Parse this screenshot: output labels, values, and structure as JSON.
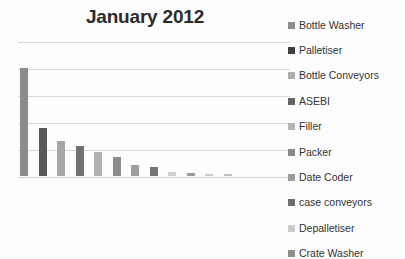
{
  "chart_data": {
    "type": "bar",
    "title": "January 2012",
    "xlabel": "",
    "ylabel": "",
    "grid": true,
    "legend_position": "right",
    "axis_tick_labels": [],
    "ylim": [
      0,
      120
    ],
    "categories": [
      "Bottle Washer",
      "Palletiser",
      "Bottle Conveyors",
      "ASEBI",
      "Filler",
      "Packer",
      "Date Coder",
      "case conveyors",
      "Depalletiser",
      "Crate Washer",
      "",
      ""
    ],
    "values": [
      96,
      43,
      31,
      27,
      21,
      17,
      10,
      8,
      4,
      3,
      2,
      2
    ],
    "bar_colors": [
      "#8c8c8c",
      "#595959",
      "#a6a6a6",
      "#737373",
      "#b0b0b0",
      "#8c8c8c",
      "#9e9e9e",
      "#767676",
      "#cfcfcf",
      "#9a9a9a",
      "#cacaca",
      "#c2c2c2"
    ]
  },
  "legend": {
    "items": [
      {
        "label": "Bottle Washer",
        "color": "#8c8c8c"
      },
      {
        "label": "Palletiser",
        "color": "#404040"
      },
      {
        "label": "Bottle Conveyors",
        "color": "#adadad"
      },
      {
        "label": "ASEBI",
        "color": "#636363"
      },
      {
        "label": "Filler",
        "color": "#b5b5b5"
      },
      {
        "label": "Packer",
        "color": "#8a8a8a"
      },
      {
        "label": "Date Coder",
        "color": "#9c9c9c"
      },
      {
        "label": "case conveyors",
        "color": "#6e6e6e"
      },
      {
        "label": "Depalletiser",
        "color": "#cccccc"
      },
      {
        "label": "Crate Washer",
        "color": "#8f8f8f"
      }
    ]
  },
  "style": {
    "background": "#fdfdfd",
    "gridline_color": "#d9d9d9",
    "title_color": "#2b2b2b",
    "legend_text_color": "#333333"
  }
}
